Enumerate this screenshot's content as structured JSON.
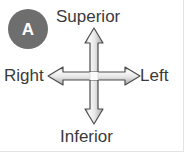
{
  "figure": {
    "background_color": "#ffffff",
    "border_color": "#e3e3e3"
  },
  "panel_badge": {
    "label": "A",
    "shape": "circle",
    "fill_color": "#6e6e6e",
    "text_color": "#ffffff"
  },
  "orientation": {
    "label_color": "#3a3a3a",
    "superior": "Superior",
    "inferior": "Inferior",
    "right": "Right",
    "left": "Left"
  },
  "arrow_cross": {
    "icon": "four-way-arrow-cross",
    "outline_color": "#4a4a4a",
    "fill_light": "#f2f2f2",
    "fill_mid": "#b9b9b9",
    "directions": [
      "up",
      "down",
      "left",
      "right"
    ]
  }
}
